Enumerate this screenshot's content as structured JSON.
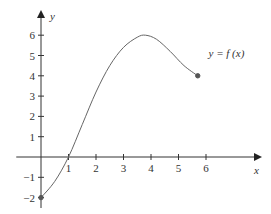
{
  "chart_data": {
    "type": "line",
    "title": "",
    "xlabel": "x",
    "ylabel": "y",
    "xlim": [
      -0.9,
      7.3
    ],
    "ylim": [
      -2.3,
      6.9
    ],
    "x_ticks": [
      1,
      2,
      3,
      4,
      5,
      6
    ],
    "y_ticks": [
      -2,
      -1,
      1,
      2,
      3,
      4,
      5,
      6
    ],
    "grid": false,
    "legend": "none",
    "series": [
      {
        "name": "y = f(x)",
        "x": [
          0,
          0.5,
          1,
          1.5,
          2,
          2.5,
          3,
          3.5,
          3.8,
          4.2,
          4.7,
          5.2,
          5.7
        ],
        "y": [
          -2,
          -1.2,
          0,
          1.6,
          3.2,
          4.5,
          5.4,
          5.9,
          6.0,
          5.8,
          5.2,
          4.5,
          4.0
        ]
      }
    ],
    "endpoints": [
      {
        "x": 0,
        "y": -2,
        "filled": true
      },
      {
        "x": 5.7,
        "y": 4,
        "filled": true
      }
    ],
    "annotations": [
      {
        "text": "y = f (x)",
        "x": 6.2,
        "y": 5.1
      }
    ]
  }
}
